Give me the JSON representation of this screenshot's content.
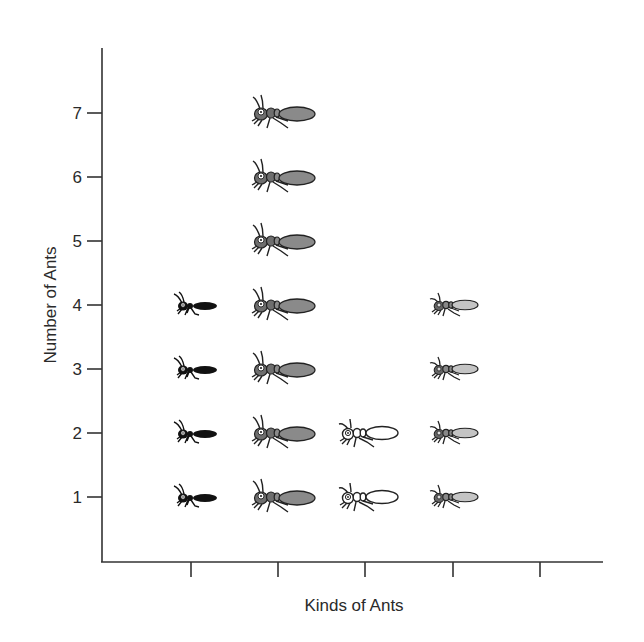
{
  "chart_data": {
    "type": "pictograph",
    "title": "",
    "xlabel": "Kinds of Ants",
    "ylabel": "Number of Ants",
    "ylim": [
      0,
      8
    ],
    "y_ticks": [
      "1",
      "2",
      "3",
      "4",
      "5",
      "6",
      "7"
    ],
    "categories": [
      "",
      "",
      "",
      "",
      ""
    ],
    "values": [
      4,
      7,
      2,
      4,
      0
    ],
    "series": [
      {
        "name": "kind-1",
        "icon": "black-ant-icon",
        "fill": "#111111",
        "count": 4
      },
      {
        "name": "kind-2",
        "icon": "large-gray-ant-icon",
        "fill": "#8a8a8a",
        "count": 7
      },
      {
        "name": "kind-3",
        "icon": "white-ant-icon",
        "fill": "#ffffff",
        "count": 2
      },
      {
        "name": "kind-4",
        "icon": "light-gray-ant-icon",
        "fill": "#c4c4c4",
        "count": 4
      },
      {
        "name": "kind-5",
        "icon": "none",
        "fill": "",
        "count": 0
      }
    ],
    "grid": false,
    "legend": "none"
  },
  "axes": {
    "x_label": "Kinds of Ants",
    "y_label": "Number of Ants",
    "y_tick_labels": [
      "1",
      "2",
      "3",
      "4",
      "5",
      "6",
      "7"
    ]
  }
}
